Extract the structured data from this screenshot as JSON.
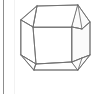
{
  "panel": {
    "width": 105,
    "height": 94,
    "background_color": "#ffffff",
    "left_rule_color": "#8d8d8d",
    "inner_rule_color": "#f2f2f2"
  },
  "figure": {
    "name": "crystal-polyhedron",
    "description": "Line drawing of a truncated polyhedral crystal",
    "stroke_color": "#6f6f6f",
    "fill_color": "#ffffff",
    "shaded_fill_color": "#fbfbfb",
    "stroke_width": 0.85,
    "faces": [
      {
        "id": "front-face",
        "label": "front",
        "points": "33,27 72,27 72,62 36,64"
      },
      {
        "id": "top-front-face",
        "label": "top-front",
        "points": "33,27 37,6 78,5 72,27"
      },
      {
        "id": "top-left-corner-face",
        "label": "top-left-corner",
        "points": "21,20 33,27 37,6"
      },
      {
        "id": "left-face",
        "label": "left",
        "points": "21,20 33,27 36,64 21,55"
      },
      {
        "id": "bottom-left-corner-face",
        "label": "bottom-left-corner",
        "points": "21,55 36,64 34,70"
      },
      {
        "id": "bottom-front-face",
        "label": "bottom-front",
        "points": "36,64 72,62 78,70 34,70"
      },
      {
        "id": "top-right-corner-face",
        "label": "top-right-corner",
        "points": "78,5 90,22 82,29 72,27"
      },
      {
        "id": "right-face",
        "label": "right",
        "points": "72,27 82,29 90,22 90,55 82,58 72,62"
      },
      {
        "id": "bottom-right-corner-face",
        "label": "bottom-right-corner",
        "points": "72,62 82,58 90,55 78,70"
      }
    ],
    "edges": [
      {
        "id": "top-edge",
        "label": "top",
        "d": "M37,6 L78,5"
      },
      {
        "id": "upper-left-edge",
        "label": "upper-left",
        "d": "M21,20 L37,6"
      },
      {
        "id": "left-vertical-edge",
        "label": "left-vertical",
        "d": "M21,20 L21,55"
      },
      {
        "id": "lower-left-edge",
        "label": "lower-left",
        "d": "M21,55 L34,70"
      },
      {
        "id": "bottom-edge",
        "label": "bottom",
        "d": "M34,70 L78,70"
      },
      {
        "id": "lower-right-edge",
        "label": "lower-right",
        "d": "M78,70 L90,55"
      },
      {
        "id": "right-vertical-edge",
        "label": "right-vertical",
        "d": "M90,22 L90,55"
      },
      {
        "id": "upper-right-edge",
        "label": "upper-right",
        "d": "M78,5 L90,22"
      },
      {
        "id": "front-top-edge",
        "label": "front-top",
        "d": "M33,27 L72,27"
      },
      {
        "id": "front-left-edge",
        "label": "front-left",
        "d": "M33,27 L36,64"
      },
      {
        "id": "front-right-edge",
        "label": "front-right",
        "d": "M72,27 L72,62"
      },
      {
        "id": "front-bottom-edge",
        "label": "front-bottom",
        "d": "M36,64 L72,62"
      },
      {
        "id": "corner-edge-top-left",
        "label": "corner-top-left",
        "d": "M21,20 L33,27"
      },
      {
        "id": "corner-edge-top-mid",
        "label": "corner-top-mid",
        "d": "M37,6 L33,27"
      },
      {
        "id": "corner-edge-bottom-left",
        "label": "corner-bottom-left",
        "d": "M21,55 L36,64"
      },
      {
        "id": "corner-edge-bottom-mid",
        "label": "corner-bottom-mid",
        "d": "M34,70 L36,64"
      },
      {
        "id": "corner-edge-top-right-a",
        "label": "corner-top-right-a",
        "d": "M78,5 L82,29"
      },
      {
        "id": "corner-edge-top-right-b",
        "label": "corner-top-right-b",
        "d": "M82,29 L90,22"
      },
      {
        "id": "corner-edge-top-right-c",
        "label": "corner-top-right-c",
        "d": "M72,27 L82,29"
      },
      {
        "id": "corner-edge-bottom-right-a",
        "label": "corner-bottom-right-a",
        "d": "M72,62 L82,58"
      },
      {
        "id": "corner-edge-bottom-right-b",
        "label": "corner-bottom-right-b",
        "d": "M82,58 L90,55"
      },
      {
        "id": "corner-edge-bottom-right-c",
        "label": "corner-bottom-right-c",
        "d": "M82,58 L78,70"
      }
    ]
  }
}
